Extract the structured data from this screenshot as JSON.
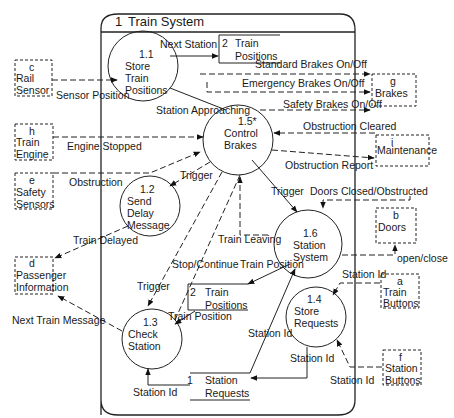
{
  "system": {
    "number": "1",
    "title": "Train System"
  },
  "processes": [
    {
      "id": "1.1",
      "lines": [
        "Store",
        "Train",
        "Positions"
      ]
    },
    {
      "id": "1.2",
      "lines": [
        "Send",
        "Delay",
        "Message"
      ]
    },
    {
      "id": "1.3",
      "lines": [
        "Check",
        "Station"
      ]
    },
    {
      "id": "1.4",
      "lines": [
        "Store",
        "Requests"
      ]
    },
    {
      "id": "1.5*",
      "lines": [
        "Control",
        "Brakes"
      ]
    },
    {
      "id": "1.6",
      "lines": [
        "Station",
        "System"
      ]
    }
  ],
  "data_stores": [
    {
      "id": "2",
      "lines": [
        "Train",
        "Positions"
      ]
    },
    {
      "id": "2",
      "lines": [
        "Train",
        "Positions"
      ]
    },
    {
      "id": "1",
      "lines": [
        "Station",
        "Requests"
      ]
    }
  ],
  "external_entities": [
    {
      "id": "c",
      "lines": [
        "Rail",
        "Sensor"
      ]
    },
    {
      "id": "h",
      "lines": [
        "Train",
        "Engine"
      ]
    },
    {
      "id": "e",
      "lines": [
        "Safety",
        "Sensors"
      ]
    },
    {
      "id": "d",
      "lines": [
        "Passenger",
        "Information"
      ]
    },
    {
      "id": "g",
      "lines": [
        "Brakes"
      ]
    },
    {
      "id": "i",
      "lines": [
        "Maintenance"
      ]
    },
    {
      "id": "b",
      "lines": [
        "Doors"
      ]
    },
    {
      "id": "a",
      "lines": [
        "Train",
        "Buttons"
      ]
    },
    {
      "id": "f",
      "lines": [
        "Station",
        "Buttons"
      ]
    }
  ],
  "flows": {
    "next_station": "Next Station",
    "sensor_position": "Sensor Position",
    "station_approaching": "Station Approaching",
    "standard_brakes": "Standard Brakes On/Off",
    "emergency_brakes": "Emergency Brakes On/Off",
    "safety_brakes": "Safety Brakes On/Off",
    "obstruction_cleared": "Obstruction Cleared",
    "obstruction_report": "Obstruction Report",
    "engine_stopped": "Engine Stopped",
    "obstruction": "Obstruction",
    "trigger_1": "Trigger",
    "trigger_2": "Trigger",
    "trigger_3": "Trigger",
    "doors_closed": "Doors Closed/Obstructed",
    "train_delayed": "Train Delayed",
    "train_leaving": "Train Leaving",
    "open_close": "open/close",
    "stop_continue": "Stop/Continue",
    "train_position_1": "Train Position",
    "train_position_2": "Train Position",
    "station_id_1": "Station Id",
    "station_id_2": "Station Id",
    "station_id_3": "Station Id",
    "station_id_4": "Station Id",
    "station_id_5": "Station Id",
    "next_train_message": "Next Train Message"
  }
}
